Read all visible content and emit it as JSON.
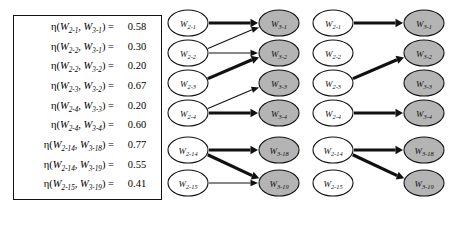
{
  "eta_table": {
    "symbol": "η",
    "equals": "=",
    "rows": [
      {
        "from": "W",
        "from_sub": "2-1",
        "to": "W",
        "to_sub": "3-1",
        "value": "0.58"
      },
      {
        "from": "W",
        "from_sub": "2-2",
        "to": "W",
        "to_sub": "3-1",
        "value": "0.30"
      },
      {
        "from": "W",
        "from_sub": "2-2",
        "to": "W",
        "to_sub": "3-2",
        "value": "0.20"
      },
      {
        "from": "W",
        "from_sub": "2-3",
        "to": "W",
        "to_sub": "3-2",
        "value": "0.67"
      },
      {
        "from": "W",
        "from_sub": "2-4",
        "to": "W",
        "to_sub": "3-3",
        "value": "0.20"
      },
      {
        "from": "W",
        "from_sub": "2-4",
        "to": "W",
        "to_sub": "3-4",
        "value": "0.60"
      },
      {
        "from": "W",
        "from_sub": "2-14",
        "to": "W",
        "to_sub": "3-18",
        "value": "0.77"
      },
      {
        "from": "W",
        "from_sub": "2-14",
        "to": "W",
        "to_sub": "3-19",
        "value": "0.55"
      },
      {
        "from": "W",
        "from_sub": "2-15",
        "to": "W",
        "to_sub": "3-19",
        "value": "0.41"
      }
    ]
  },
  "graph_all": {
    "caption": "",
    "left_nodes": [
      {
        "base": "W",
        "sub": "2-1"
      },
      {
        "base": "W",
        "sub": "2-2"
      },
      {
        "base": "W",
        "sub": "2-3"
      },
      {
        "base": "W",
        "sub": "2-4"
      },
      {
        "base": "W",
        "sub": "2-14"
      },
      {
        "base": "W",
        "sub": "2-15"
      }
    ],
    "right_nodes": [
      {
        "base": "W",
        "sub": "3-1"
      },
      {
        "base": "W",
        "sub": "3-2"
      },
      {
        "base": "W",
        "sub": "3-3"
      },
      {
        "base": "W",
        "sub": "3-4"
      },
      {
        "base": "W",
        "sub": "3-18"
      },
      {
        "base": "W",
        "sub": "3-19"
      }
    ],
    "edges": [
      {
        "from": 0,
        "to": 0,
        "weight": "0.58",
        "strength": "strong"
      },
      {
        "from": 1,
        "to": 0,
        "weight": "0.30",
        "strength": "weak"
      },
      {
        "from": 1,
        "to": 1,
        "weight": "0.20",
        "strength": "weak"
      },
      {
        "from": 2,
        "to": 1,
        "weight": "0.67",
        "strength": "strong"
      },
      {
        "from": 3,
        "to": 2,
        "weight": "0.20",
        "strength": "weak"
      },
      {
        "from": 3,
        "to": 3,
        "weight": "0.60",
        "strength": "strong"
      },
      {
        "from": 4,
        "to": 4,
        "weight": "0.77",
        "strength": "strong"
      },
      {
        "from": 4,
        "to": 5,
        "weight": "0.55",
        "strength": "strong"
      },
      {
        "from": 5,
        "to": 5,
        "weight": "0.41",
        "strength": "weak"
      }
    ]
  },
  "graph_pruned": {
    "caption": "",
    "left_nodes": [
      {
        "base": "W",
        "sub": "2-1"
      },
      {
        "base": "W",
        "sub": "2-2"
      },
      {
        "base": "W",
        "sub": "2-3"
      },
      {
        "base": "W",
        "sub": "2-4"
      },
      {
        "base": "W",
        "sub": "2-14"
      },
      {
        "base": "W",
        "sub": "2-15"
      }
    ],
    "right_nodes": [
      {
        "base": "W",
        "sub": "3-1"
      },
      {
        "base": "W",
        "sub": "3-2"
      },
      {
        "base": "W",
        "sub": "3-3"
      },
      {
        "base": "W",
        "sub": "3-4"
      },
      {
        "base": "W",
        "sub": "3-18"
      },
      {
        "base": "W",
        "sub": "3-19"
      }
    ],
    "edges": [
      {
        "from": 0,
        "to": 0,
        "weight": "0.58",
        "strength": "strong"
      },
      {
        "from": 2,
        "to": 1,
        "weight": "0.67",
        "strength": "strong"
      },
      {
        "from": 3,
        "to": 3,
        "weight": "0.60",
        "strength": "strong"
      },
      {
        "from": 4,
        "to": 4,
        "weight": "0.77",
        "strength": "strong"
      },
      {
        "from": 4,
        "to": 5,
        "weight": "0.55",
        "strength": "strong"
      }
    ]
  },
  "colors": {
    "node_left_fill": "#ffffff",
    "node_right_fill": "#b4b4b4",
    "stroke": "#111111",
    "background": "#ffffff"
  },
  "layout": {
    "node_rows_y": [
      23,
      53,
      83,
      113,
      150,
      183
    ],
    "left_cx": 22,
    "right_cx": 113,
    "rx": 20,
    "ry": 13
  }
}
